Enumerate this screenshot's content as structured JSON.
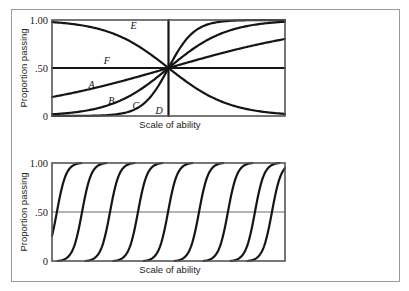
{
  "chart_data": [
    {
      "type": "line",
      "title": "",
      "xlabel": "Scale of ability",
      "ylabel": "Proportion passing",
      "xlim": [
        -1,
        1
      ],
      "ylim": [
        0,
        1
      ],
      "yticks": [
        {
          "value": 1.0,
          "label": "1.00"
        },
        {
          "value": 0.5,
          "label": ".50"
        },
        {
          "value": 0.0,
          "label": "0"
        }
      ],
      "grid": false,
      "series": [
        {
          "name": "A",
          "kind": "logistic",
          "midpoint": 0,
          "slope": 1.4,
          "note": "shallow rise, ~0.22 at left to ~0.70 at right"
        },
        {
          "name": "B",
          "kind": "logistic",
          "midpoint": 0,
          "slope": 4.0,
          "note": "~0 at left to ~0.96 at right"
        },
        {
          "name": "C",
          "kind": "logistic",
          "midpoint": 0,
          "slope": 9.0,
          "note": "steep rise near center"
        },
        {
          "name": "D",
          "kind": "step",
          "midpoint": 0,
          "note": "vertical step at center"
        },
        {
          "name": "E",
          "kind": "logistic",
          "midpoint": 0,
          "slope": -3.8,
          "note": "decreasing, ~1.0 at upper left to ~0 at right"
        },
        {
          "name": "F",
          "kind": "constant",
          "value": 0.5
        }
      ],
      "labels": [
        {
          "text": "A",
          "x": -0.66,
          "y": 0.29
        },
        {
          "text": "B",
          "x": -0.49,
          "y": 0.13
        },
        {
          "text": "C",
          "x": -0.28,
          "y": 0.07
        },
        {
          "text": "D",
          "x": -0.08,
          "y": 0.02
        },
        {
          "text": "E",
          "x": -0.3,
          "y": 0.91
        },
        {
          "text": "F",
          "x": -0.53,
          "y": 0.54
        }
      ]
    },
    {
      "type": "line",
      "title": "",
      "xlabel": "Scale of ability",
      "ylabel": "Proportion passing",
      "xlim": [
        0,
        10
      ],
      "ylim": [
        0,
        1
      ],
      "yticks": [
        {
          "value": 1.0,
          "label": "1.00"
        },
        {
          "value": 0.5,
          "label": ".50"
        },
        {
          "value": 0.0,
          "label": "0"
        }
      ],
      "reference_line": 0.5,
      "grid": false,
      "series_kind": "logistic",
      "slope": 5.0,
      "series": [
        {
          "name": "item-1",
          "midpoint": 0.21
        },
        {
          "name": "item-2",
          "midpoint": 1.29
        },
        {
          "name": "item-3",
          "midpoint": 2.49
        },
        {
          "name": "item-4",
          "midpoint": 3.69
        },
        {
          "name": "item-5",
          "midpoint": 4.98
        },
        {
          "name": "item-6",
          "midpoint": 6.31
        },
        {
          "name": "item-7",
          "midpoint": 7.55
        },
        {
          "name": "item-8",
          "midpoint": 8.71
        },
        {
          "name": "item-9",
          "midpoint": 9.44
        }
      ]
    }
  ]
}
